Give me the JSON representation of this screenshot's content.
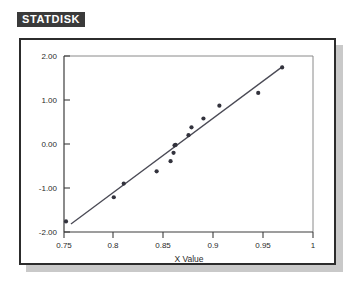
{
  "window": {
    "badge_label": "STATDISK",
    "badge_bg": "#3a3a3a",
    "badge_fg": "#ffffff",
    "panel_border_color": "#2c2c2c",
    "panel_bg": "#ffffff",
    "shadow_color": "#c9c9c9"
  },
  "chart_data": {
    "type": "scatter",
    "title": "",
    "xlabel": "X Value",
    "ylabel": "",
    "xlim": [
      0.75,
      1.0
    ],
    "ylim": [
      -2.0,
      2.0
    ],
    "grid": false,
    "legend": "none",
    "xticks": [
      0.75,
      0.8,
      0.85,
      0.9,
      0.95,
      1
    ],
    "xticklabels": [
      "0.75",
      "0.8",
      "0.85",
      "0.9",
      "0.95",
      "1"
    ],
    "yticks": [
      -2.0,
      -1.0,
      0.0,
      1.0,
      2.0
    ],
    "yticklabels": [
      "-2.00",
      "-1.00",
      "0.00",
      "1.00",
      "2.00"
    ],
    "marker_color": "#33333d",
    "line_color": "#4a4a55",
    "series": [
      {
        "name": "Normal Quantile Points",
        "type": "scatter",
        "x": [
          0.752,
          0.8,
          0.81,
          0.843,
          0.857,
          0.86,
          0.861,
          0.862,
          0.875,
          0.878,
          0.89,
          0.906,
          0.945,
          0.969
        ],
        "y": [
          -1.76,
          -1.21,
          -0.9,
          -0.62,
          -0.39,
          -0.2,
          -0.03,
          -0.02,
          0.2,
          0.38,
          0.58,
          0.87,
          1.16,
          1.74
        ]
      },
      {
        "name": "Fitted Line",
        "type": "line",
        "x": [
          0.757,
          0.97
        ],
        "y": [
          -1.82,
          1.77
        ]
      }
    ]
  }
}
